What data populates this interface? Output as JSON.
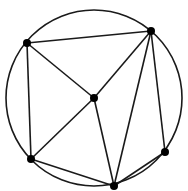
{
  "diagram": {
    "type": "inscribed-graph",
    "circle": {
      "cx": 94,
      "cy": 98,
      "r": 88,
      "stroke": "#1a1a1a"
    },
    "nodes": [
      {
        "id": "A",
        "x": 27,
        "y": 43
      },
      {
        "id": "B",
        "x": 151,
        "y": 31
      },
      {
        "id": "C",
        "x": 94,
        "y": 98
      },
      {
        "id": "D",
        "x": 31,
        "y": 159
      },
      {
        "id": "E",
        "x": 114,
        "y": 186
      },
      {
        "id": "F",
        "x": 165,
        "y": 152
      }
    ],
    "edges": [
      [
        "A",
        "B"
      ],
      [
        "A",
        "C"
      ],
      [
        "A",
        "D"
      ],
      [
        "B",
        "C"
      ],
      [
        "B",
        "E"
      ],
      [
        "B",
        "F"
      ],
      [
        "C",
        "D"
      ],
      [
        "C",
        "E"
      ],
      [
        "D",
        "E"
      ],
      [
        "E",
        "F"
      ]
    ],
    "node_radius": 4,
    "node_color": "#000000",
    "edge_color": "#1a1a1a"
  }
}
